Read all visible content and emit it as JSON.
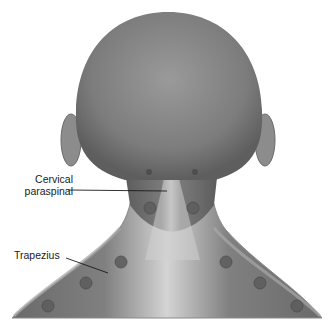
{
  "figure": {
    "labels": {
      "cervical_line1": "Cervical",
      "cervical_line2": "paraspinal",
      "trapezius": "Trapezius"
    },
    "trigger_points": [
      {
        "region": "cervical paraspinal",
        "side": "left",
        "x": 150,
        "y": 208
      },
      {
        "region": "cervical paraspinal",
        "side": "right",
        "x": 193,
        "y": 208
      },
      {
        "region": "trapezius",
        "side": "left",
        "x": 121,
        "y": 262
      },
      {
        "region": "trapezius",
        "side": "right",
        "x": 226,
        "y": 262
      },
      {
        "region": "trapezius",
        "side": "left",
        "x": 86,
        "y": 283
      },
      {
        "region": "trapezius",
        "side": "right",
        "x": 260,
        "y": 283
      },
      {
        "region": "trapezius",
        "side": "left",
        "x": 48,
        "y": 306
      },
      {
        "region": "trapezius",
        "side": "right",
        "x": 297,
        "y": 306
      }
    ],
    "colors": {
      "skin_dark": "#6e6e6e",
      "skin_mid": "#8a8a8a",
      "skin_light": "#c9c9c9",
      "point": "#5a5a5a",
      "text": "#1a1a1a"
    }
  }
}
